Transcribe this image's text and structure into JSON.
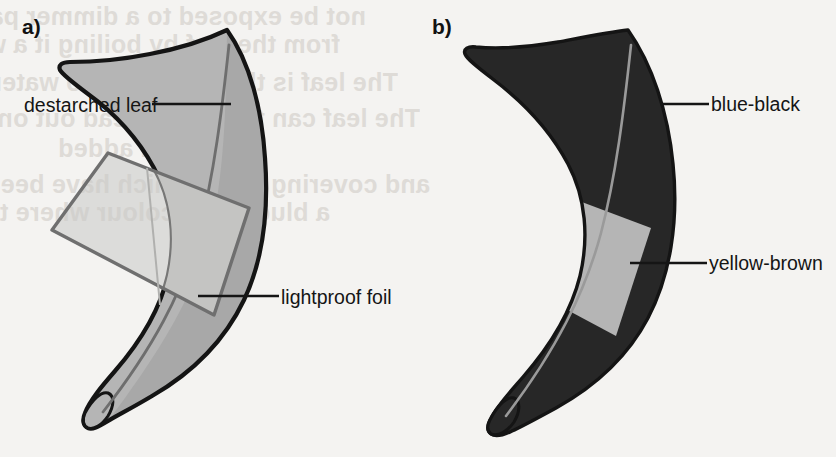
{
  "figure": {
    "type": "diagram",
    "panels": [
      {
        "letter": "a)",
        "name": "panel-a-setup",
        "callouts": [
          {
            "label": "destarched leaf",
            "name": "label-destarched-leaf"
          },
          {
            "label": "lightproof foil",
            "name": "label-lightproof-foil"
          }
        ]
      },
      {
        "letter": "b)",
        "name": "panel-b-result",
        "callouts": [
          {
            "label": "blue-black",
            "name": "label-blue-black"
          },
          {
            "label": "yellow-brown",
            "name": "label-yellow-brown"
          }
        ]
      }
    ]
  },
  "panel_a": {
    "letter": "a)",
    "label_destarched": "destarched leaf",
    "label_lightproof": "lightproof foil"
  },
  "panel_b": {
    "letter": "b)",
    "label_blue_black": "blue-black",
    "label_yellow_brown": "yellow-brown"
  },
  "colors": {
    "background": "#f4f3f1",
    "leaf_gray": "#b3b3b3",
    "leaf_gray_dark": "#a2a2a2",
    "foil_light": "#c9c9c7",
    "foil_mid": "#bdbdbb",
    "leaf_outline": "#151515",
    "foil_outline": "#6a6a6a",
    "blue_black": "#262626",
    "yellow_brown": "#b5b5b5",
    "text": "#151515",
    "ghost_text": "#dedbd7",
    "leader_line": "#151515"
  },
  "ghost_text": {
    "description": "faint mirrored show-through text from the reverse side of the printed page",
    "lines": [
      "not be exposed to a dimmer part of",
      "from the leaf by boiling it a white",
      "The leaf is then dipped into water again",
      "The leaf can then be spread out on a white",
      "solution added",
      "and covering areas which have been exposed",
      "a blue-black colour where the covered areas"
    ]
  }
}
